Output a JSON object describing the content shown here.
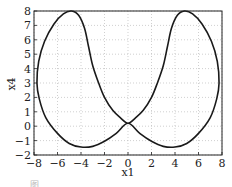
{
  "chart_data": {
    "type": "line",
    "title": "",
    "xlabel": "x1",
    "ylabel": "x4",
    "xlim": [
      -8,
      8
    ],
    "ylim": [
      -2,
      8
    ],
    "xticks": [
      -8,
      -6,
      -4,
      -2,
      0,
      2,
      4,
      6,
      8
    ],
    "yticks": [
      -2,
      -1,
      0,
      1,
      2,
      3,
      4,
      5,
      6,
      7,
      8
    ],
    "xtick_labels": [
      "−8",
      "−6",
      "−4",
      "−2",
      "0",
      "2",
      "4",
      "6",
      "8"
    ],
    "ytick_labels": [
      "−2",
      "−1",
      "0",
      "1",
      "2",
      "3",
      "4",
      "5",
      "6",
      "7",
      "8"
    ],
    "grid": true,
    "grid_style": "dotted",
    "legend": null,
    "series": [
      {
        "name": "phase trajectory (x1 vs x4)",
        "color": "#1a1a1a",
        "closed": true,
        "points": [
          [
            0,
            0.2
          ],
          [
            -1,
            -0.5
          ],
          [
            -2,
            -1.05
          ],
          [
            -3,
            -1.4
          ],
          [
            -4,
            -1.45
          ],
          [
            -5,
            -1.2
          ],
          [
            -6,
            -0.5
          ],
          [
            -7,
            0.6
          ],
          [
            -7.55,
            1.9
          ],
          [
            -7.75,
            3.0
          ],
          [
            -7.6,
            4.5
          ],
          [
            -7.1,
            5.9
          ],
          [
            -6.3,
            7.1
          ],
          [
            -5.5,
            7.8
          ],
          [
            -4.8,
            8.0
          ],
          [
            -4.2,
            7.7
          ],
          [
            -3.7,
            6.8
          ],
          [
            -3.35,
            5.5
          ],
          [
            -3.0,
            4.2
          ],
          [
            -2.5,
            3.0
          ],
          [
            -2.0,
            2.0
          ],
          [
            -1.3,
            1.1
          ],
          [
            -0.6,
            0.55
          ],
          [
            0,
            0.2
          ],
          [
            0.6,
            0.55
          ],
          [
            1.3,
            1.1
          ],
          [
            2.0,
            2.0
          ],
          [
            2.5,
            3.0
          ],
          [
            3.0,
            4.2
          ],
          [
            3.35,
            5.5
          ],
          [
            3.7,
            6.8
          ],
          [
            4.2,
            7.7
          ],
          [
            4.8,
            8.0
          ],
          [
            5.5,
            7.8
          ],
          [
            6.3,
            7.1
          ],
          [
            7.1,
            5.9
          ],
          [
            7.6,
            4.5
          ],
          [
            7.75,
            3.0
          ],
          [
            7.55,
            1.9
          ],
          [
            7.0,
            0.6
          ],
          [
            6.0,
            -0.5
          ],
          [
            5.0,
            -1.2
          ],
          [
            4.0,
            -1.45
          ],
          [
            3.0,
            -1.4
          ],
          [
            2.0,
            -1.05
          ],
          [
            1.0,
            -0.5
          ],
          [
            0,
            0.2
          ]
        ]
      }
    ]
  },
  "caption": "图 …"
}
